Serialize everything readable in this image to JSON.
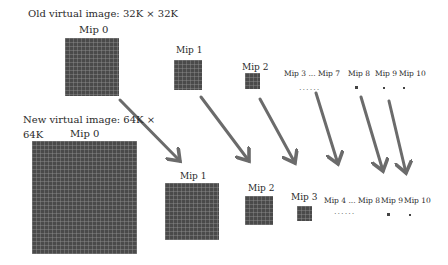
{
  "old_image": {
    "title": "Old virtual image: 32K × 32K",
    "mips": [
      {
        "label": "Mip 0"
      },
      {
        "label": "Mip 1"
      },
      {
        "label": "Mip 2"
      },
      {
        "label": "Mip 3 ... Mip 7",
        "ellipsis": "......"
      },
      {
        "label": "Mip 8"
      },
      {
        "label": "Mip 9"
      },
      {
        "label": "Mip 10"
      }
    ]
  },
  "new_image": {
    "title_line1": "New virtual image: 64K ×",
    "title_line2": "64K",
    "mips": [
      {
        "label": "Mip 0"
      },
      {
        "label": "Mip 1"
      },
      {
        "label": "Mip 2"
      },
      {
        "label": "Mip 3"
      },
      {
        "label": "Mip 4 ... Mip 8",
        "ellipsis": "......"
      },
      {
        "label": "Mip 9"
      },
      {
        "label": "Mip 10"
      }
    ]
  },
  "colors": {
    "texture": "#4a4a4a",
    "arrow": "#6b6b6b",
    "background": "#ffffff"
  }
}
